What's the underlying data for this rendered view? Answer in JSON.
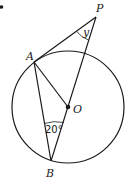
{
  "diagram": {
    "type": "circle-geometry",
    "points": {
      "P": {
        "label": "P",
        "x": 96,
        "y": 17
      },
      "A": {
        "label": "A",
        "x": 34,
        "y": 62
      },
      "O": {
        "label": "O",
        "x": 68,
        "y": 107
      },
      "B": {
        "label": "B",
        "x": 51,
        "y": 161
      }
    },
    "circle": {
      "center": "O",
      "radius": 56
    },
    "segments": [
      "PA",
      "PB",
      "AO",
      "AB"
    ],
    "angles": {
      "at_P": {
        "label": "y"
      },
      "at_B": {
        "label": "20°"
      }
    },
    "colors": {
      "stroke": "#1a1a1a",
      "background": "#ffffff"
    }
  }
}
